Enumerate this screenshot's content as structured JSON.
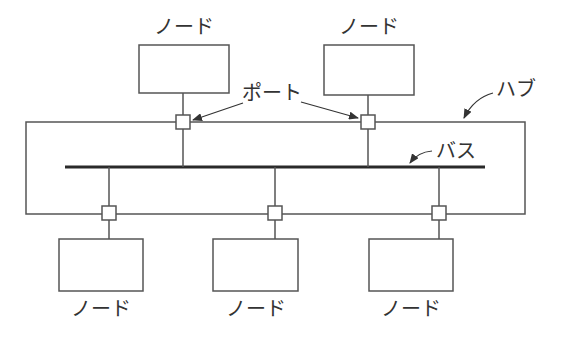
{
  "diagram": {
    "type": "hub-bus-topology",
    "colors": {
      "line": "#555555",
      "bus": "#2a2a2a",
      "text": "#333333",
      "background": "#ffffff"
    },
    "labels": {
      "node": "ノード",
      "port": "ポート",
      "hub": "ハブ",
      "bus": "バス"
    },
    "top_nodes": [
      {
        "id": "top-node-1",
        "label": "ノード"
      },
      {
        "id": "top-node-2",
        "label": "ノード"
      }
    ],
    "bottom_nodes": [
      {
        "id": "bottom-node-1",
        "label": "ノード"
      },
      {
        "id": "bottom-node-2",
        "label": "ノード"
      },
      {
        "id": "bottom-node-3",
        "label": "ノード"
      }
    ],
    "ports_count": 5
  }
}
